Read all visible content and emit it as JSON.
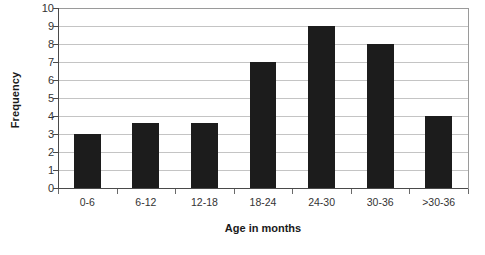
{
  "chart_data": {
    "type": "bar",
    "title": "",
    "categories": [
      "0-6",
      "6-12",
      "12-18",
      "18-24",
      "24-30",
      "30-36",
      ">30-36"
    ],
    "values": [
      3,
      3.6,
      3.6,
      7,
      9,
      8,
      4
    ],
    "xlabel": "Age in months",
    "ylabel": "Frequency",
    "ylim": [
      0,
      10
    ],
    "ytick_labels": [
      "10",
      "9",
      "8",
      "7",
      "6",
      "5",
      "4",
      "3",
      "2",
      "1",
      "0"
    ],
    "ytick_values": [
      10,
      9,
      8,
      7,
      6,
      5,
      4,
      3,
      2,
      1,
      0
    ],
    "grid": true,
    "legend": false,
    "bar_color": "#1c1c1c",
    "grid_color": "#c4c4c4",
    "axis_color": "#4a4a4a"
  }
}
